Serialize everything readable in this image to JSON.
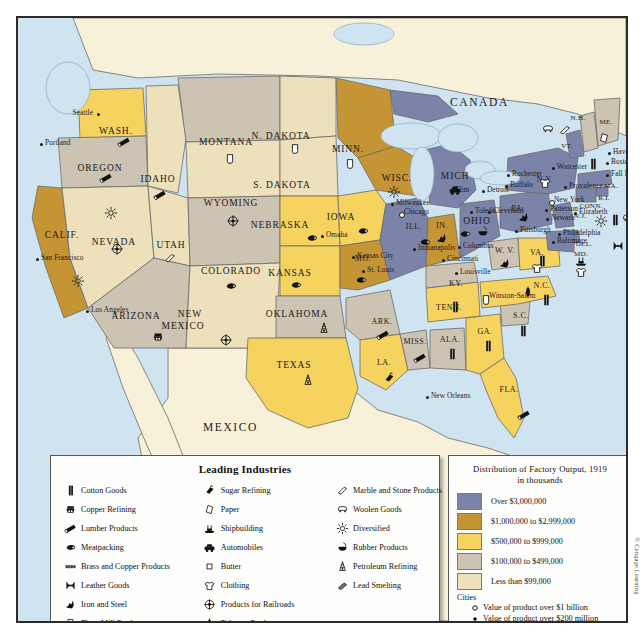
{
  "map": {
    "countries": [
      {
        "name": "CANADA",
        "x": 432,
        "y": 78
      },
      {
        "name": "MEXICO",
        "x": 185,
        "y": 403
      }
    ],
    "states": [
      {
        "abbr": "WASH.",
        "x": 98,
        "y": 113,
        "size": "state"
      },
      {
        "abbr": "OREGON",
        "x": 82,
        "y": 150,
        "size": "state"
      },
      {
        "abbr": "IDAHO",
        "x": 140,
        "y": 161,
        "size": "state"
      },
      {
        "abbr": "MONTANA",
        "x": 208,
        "y": 124,
        "size": "state"
      },
      {
        "abbr": "WYOMING",
        "x": 213,
        "y": 185,
        "size": "state"
      },
      {
        "abbr": "NEVADA",
        "x": 96,
        "y": 224,
        "size": "state"
      },
      {
        "abbr": "CALIF.",
        "x": 44,
        "y": 217,
        "size": "state"
      },
      {
        "abbr": "UTAH",
        "x": 153,
        "y": 227,
        "size": "state"
      },
      {
        "abbr": "COLORADO",
        "x": 213,
        "y": 253,
        "size": "state"
      },
      {
        "abbr": "ARIZONA",
        "x": 118,
        "y": 298,
        "size": "state"
      },
      {
        "abbr": "NEW",
        "x": 172,
        "y": 296,
        "size": "state"
      },
      {
        "abbr": "MEXICO",
        "x": 165,
        "y": 308,
        "size": "state"
      },
      {
        "abbr": "N. DAKOTA",
        "x": 263,
        "y": 118,
        "size": "state"
      },
      {
        "abbr": "S. DAKOTA",
        "x": 264,
        "y": 167,
        "size": "state"
      },
      {
        "abbr": "NEBRASKA",
        "x": 262,
        "y": 207,
        "size": "state"
      },
      {
        "abbr": "KANSAS",
        "x": 272,
        "y": 255,
        "size": "state"
      },
      {
        "abbr": "OKLAHOMA",
        "x": 279,
        "y": 296,
        "size": "state"
      },
      {
        "abbr": "TEXAS",
        "x": 276,
        "y": 347,
        "size": "state"
      },
      {
        "abbr": "MINN.",
        "x": 330,
        "y": 131,
        "size": "state"
      },
      {
        "abbr": "IOWA",
        "x": 323,
        "y": 199,
        "size": "state"
      },
      {
        "abbr": "MO.",
        "x": 345,
        "y": 240,
        "size": "sm"
      },
      {
        "abbr": "ARK.",
        "x": 364,
        "y": 303,
        "size": "sm"
      },
      {
        "abbr": "LA.",
        "x": 366,
        "y": 344,
        "size": "sm"
      },
      {
        "abbr": "WISC.",
        "x": 379,
        "y": 160,
        "size": "state"
      },
      {
        "abbr": "ILL.",
        "x": 396,
        "y": 208,
        "size": "sm"
      },
      {
        "abbr": "MISS.",
        "x": 397,
        "y": 323,
        "size": "sm"
      },
      {
        "abbr": "ALA.",
        "x": 432,
        "y": 321,
        "size": "sm"
      },
      {
        "abbr": "TENN.",
        "x": 431,
        "y": 289,
        "size": "sm"
      },
      {
        "abbr": "KY.",
        "x": 438,
        "y": 265,
        "size": "sm"
      },
      {
        "abbr": "IN.",
        "x": 424,
        "y": 207,
        "size": "sm"
      },
      {
        "abbr": "MICH",
        "x": 437,
        "y": 158,
        "size": "state"
      },
      {
        "abbr": "OHIO",
        "x": 459,
        "y": 203,
        "size": "state"
      },
      {
        "abbr": "GA.",
        "x": 467,
        "y": 313,
        "size": "sm"
      },
      {
        "abbr": "FLA.",
        "x": 491,
        "y": 371,
        "size": "sm"
      },
      {
        "abbr": "S.C.",
        "x": 503,
        "y": 297,
        "size": "sm"
      },
      {
        "abbr": "N.C.",
        "x": 524,
        "y": 267,
        "size": "sm"
      },
      {
        "abbr": "W. V.",
        "x": 487,
        "y": 232,
        "size": "sm"
      },
      {
        "abbr": "VA.",
        "x": 519,
        "y": 234,
        "size": "sm"
      },
      {
        "abbr": "PA.",
        "x": 500,
        "y": 190,
        "size": "sm"
      },
      {
        "abbr": "N.Y.",
        "x": 527,
        "y": 161,
        "size": "sm"
      },
      {
        "abbr": "VT.",
        "x": 549,
        "y": 128,
        "size": "xs"
      },
      {
        "abbr": "N.H.",
        "x": 560,
        "y": 100,
        "size": "xs"
      },
      {
        "abbr": "ME.",
        "x": 588,
        "y": 104,
        "size": "xs"
      },
      {
        "abbr": "MA.",
        "x": 593,
        "y": 168,
        "size": "xs"
      },
      {
        "abbr": "R.I.",
        "x": 586,
        "y": 180,
        "size": "xs"
      },
      {
        "abbr": "CONN.",
        "x": 573,
        "y": 188,
        "size": "xs"
      },
      {
        "abbr": "N.J.",
        "x": 562,
        "y": 198,
        "size": "xs"
      },
      {
        "abbr": "DEL.",
        "x": 566,
        "y": 226,
        "size": "xs"
      },
      {
        "abbr": "MD.",
        "x": 563,
        "y": 236,
        "size": "xs"
      }
    ],
    "cities": [
      {
        "name": "Seattle",
        "x": 79,
        "y": 94,
        "dot": "solid",
        "align": "right"
      },
      {
        "name": "Portland",
        "x": 22,
        "y": 124,
        "dot": "solid",
        "align": "left"
      },
      {
        "name": "San Francisco",
        "x": 18,
        "y": 239,
        "dot": "solid",
        "align": "left"
      },
      {
        "name": "Los Angeles",
        "x": 68,
        "y": 291,
        "dot": "solid",
        "align": "left"
      },
      {
        "name": "Omaha",
        "x": 303,
        "y": 216,
        "dot": "solid",
        "align": "left"
      },
      {
        "name": "Kansas City",
        "x": 334,
        "y": 237,
        "dot": "solid",
        "align": "left"
      },
      {
        "name": "St. Louis",
        "x": 344,
        "y": 251,
        "dot": "solid",
        "align": "left"
      },
      {
        "name": "Milwaukee",
        "x": 373,
        "y": 184,
        "dot": "solid",
        "align": "left"
      },
      {
        "name": "Chicago",
        "x": 381,
        "y": 193,
        "dot": "hollow",
        "align": "left"
      },
      {
        "name": "Indianapolis",
        "x": 395,
        "y": 229,
        "dot": "solid",
        "align": "left"
      },
      {
        "name": "Cincinnati",
        "x": 424,
        "y": 240,
        "dot": "solid",
        "align": "left"
      },
      {
        "name": "Columbus",
        "x": 440,
        "y": 227,
        "dot": "solid",
        "align": "left"
      },
      {
        "name": "Louisville",
        "x": 437,
        "y": 253,
        "dot": "solid",
        "align": "left"
      },
      {
        "name": "Flint",
        "x": 432,
        "y": 171,
        "dot": "solid",
        "align": "left"
      },
      {
        "name": "Detroit",
        "x": 464,
        "y": 171,
        "dot": "solid",
        "align": "left"
      },
      {
        "name": "Toledo",
        "x": 452,
        "y": 192,
        "dot": "solid",
        "align": "left"
      },
      {
        "name": "Cleveland",
        "x": 470,
        "y": 192,
        "dot": "solid",
        "align": "left"
      },
      {
        "name": "Rochester",
        "x": 489,
        "y": 155,
        "dot": "solid",
        "align": "left"
      },
      {
        "name": "Buffalo",
        "x": 487,
        "y": 166,
        "dot": "solid",
        "align": "left"
      },
      {
        "name": "Pittsburgh",
        "x": 497,
        "y": 211,
        "dot": "solid",
        "align": "left"
      },
      {
        "name": "Worcester",
        "x": 534,
        "y": 148,
        "dot": "solid",
        "align": "left"
      },
      {
        "name": "Providence",
        "x": 546,
        "y": 167,
        "dot": "solid",
        "align": "left"
      },
      {
        "name": "Haverhill",
        "x": 590,
        "y": 133,
        "dot": "solid",
        "align": "left"
      },
      {
        "name": "Boston",
        "x": 588,
        "y": 143,
        "dot": "solid",
        "align": "left"
      },
      {
        "name": "Fall River",
        "x": 588,
        "y": 155,
        "dot": "solid",
        "align": "left"
      },
      {
        "name": "New York",
        "x": 531,
        "y": 181,
        "dot": "hollow",
        "align": "left"
      },
      {
        "name": "Patterson",
        "x": 527,
        "y": 190,
        "dot": "solid",
        "align": "left"
      },
      {
        "name": "Newark",
        "x": 528,
        "y": 199,
        "dot": "solid",
        "align": "left"
      },
      {
        "name": "Elizabeth",
        "x": 556,
        "y": 193,
        "dot": "solid",
        "align": "left"
      },
      {
        "name": "Philadelphia",
        "x": 540,
        "y": 214,
        "dot": "solid",
        "align": "left"
      },
      {
        "name": "Baltimore",
        "x": 534,
        "y": 222,
        "dot": "solid",
        "align": "left"
      },
      {
        "name": "Winston-Salem",
        "x": 466,
        "y": 277,
        "dot": "solid",
        "align": "left"
      },
      {
        "name": "New Orleans",
        "x": 408,
        "y": 377,
        "dot": "solid",
        "align": "left"
      }
    ],
    "industry_markers": [
      {
        "icon": "lumber",
        "x": 106,
        "y": 124
      },
      {
        "icon": "lumber",
        "x": 88,
        "y": 160
      },
      {
        "icon": "lumber",
        "x": 142,
        "y": 177
      },
      {
        "icon": "flour",
        "x": 212,
        "y": 141
      },
      {
        "icon": "flour",
        "x": 277,
        "y": 131
      },
      {
        "icon": "railroads",
        "x": 215,
        "y": 203
      },
      {
        "icon": "diversified",
        "x": 93,
        "y": 195
      },
      {
        "icon": "diversified",
        "x": 60,
        "y": 263
      },
      {
        "icon": "railroads",
        "x": 99,
        "y": 231
      },
      {
        "icon": "marble",
        "x": 152,
        "y": 240
      },
      {
        "icon": "railroads",
        "x": 208,
        "y": 322
      },
      {
        "icon": "copper",
        "x": 140,
        "y": 319
      },
      {
        "icon": "meat",
        "x": 294,
        "y": 220
      },
      {
        "icon": "meat",
        "x": 278,
        "y": 267
      },
      {
        "icon": "meat",
        "x": 213,
        "y": 268
      },
      {
        "icon": "petroleum",
        "x": 306,
        "y": 310
      },
      {
        "icon": "petroleum",
        "x": 290,
        "y": 362
      },
      {
        "icon": "flour",
        "x": 332,
        "y": 146
      },
      {
        "icon": "meat",
        "x": 345,
        "y": 213
      },
      {
        "icon": "meat",
        "x": 343,
        "y": 262
      },
      {
        "icon": "lumber",
        "x": 365,
        "y": 317
      },
      {
        "icon": "lumber",
        "x": 402,
        "y": 340
      },
      {
        "icon": "sugar",
        "x": 371,
        "y": 360
      },
      {
        "icon": "cotton",
        "x": 434,
        "y": 336
      },
      {
        "icon": "diversified",
        "x": 376,
        "y": 174
      },
      {
        "icon": "meat",
        "x": 407,
        "y": 224
      },
      {
        "icon": "automobiles",
        "x": 437,
        "y": 172
      },
      {
        "icon": "iron",
        "x": 424,
        "y": 220
      },
      {
        "icon": "meat",
        "x": 447,
        "y": 216
      },
      {
        "icon": "rubber",
        "x": 465,
        "y": 214
      },
      {
        "icon": "flour",
        "x": 468,
        "y": 282
      },
      {
        "icon": "cotton",
        "x": 437,
        "y": 289
      },
      {
        "icon": "cotton",
        "x": 470,
        "y": 328
      },
      {
        "icon": "cotton",
        "x": 505,
        "y": 313
      },
      {
        "icon": "cotton",
        "x": 528,
        "y": 282
      },
      {
        "icon": "tobacco",
        "x": 510,
        "y": 274
      },
      {
        "icon": "cotton",
        "x": 524,
        "y": 243
      },
      {
        "icon": "iron",
        "x": 487,
        "y": 245
      },
      {
        "icon": "iron",
        "x": 506,
        "y": 199
      },
      {
        "icon": "clothing",
        "x": 519,
        "y": 250
      },
      {
        "icon": "lumber",
        "x": 506,
        "y": 397
      },
      {
        "icon": "woolen",
        "x": 530,
        "y": 111
      },
      {
        "icon": "marble",
        "x": 547,
        "y": 112
      },
      {
        "icon": "paper",
        "x": 586,
        "y": 120
      },
      {
        "icon": "clothing",
        "x": 527,
        "y": 165
      },
      {
        "icon": "cotton",
        "x": 575,
        "y": 146
      },
      {
        "icon": "cotton",
        "x": 597,
        "y": 202
      },
      {
        "icon": "woolen",
        "x": 610,
        "y": 200
      },
      {
        "icon": "diversified",
        "x": 583,
        "y": 203
      },
      {
        "icon": "leather",
        "x": 600,
        "y": 228
      },
      {
        "icon": "shipbuilding",
        "x": 563,
        "y": 243
      },
      {
        "icon": "clothing",
        "x": 563,
        "y": 254
      }
    ]
  },
  "legend_industries": {
    "title": "Leading Industries",
    "columns": [
      [
        {
          "icon": "cotton",
          "label": "Cotton Goods"
        },
        {
          "icon": "copper",
          "label": "Copper Refining"
        },
        {
          "icon": "lumber",
          "label": "Lumber Products"
        },
        {
          "icon": "meat",
          "label": "Meatpacking"
        },
        {
          "icon": "brass",
          "label": "Brass and Copper Products"
        },
        {
          "icon": "leather",
          "label": "Leather Goods"
        },
        {
          "icon": "iron",
          "label": "Iron and Steel"
        },
        {
          "icon": "flour",
          "label": "Flour Mill Products"
        }
      ],
      [
        {
          "icon": "sugar",
          "label": "Sugar Refining"
        },
        {
          "icon": "paper",
          "label": "Paper"
        },
        {
          "icon": "shipbuilding",
          "label": "Shipbuilding"
        },
        {
          "icon": "automobiles",
          "label": "Automobiles"
        },
        {
          "icon": "butter",
          "label": "Butter"
        },
        {
          "icon": "clothing",
          "label": "Clothing"
        },
        {
          "icon": "railroads",
          "label": "Products for Railroads"
        },
        {
          "icon": "tobacco",
          "label": "Tobacco Products"
        }
      ],
      [
        {
          "icon": "marble",
          "label": "Marble and Stone Products"
        },
        {
          "icon": "woolen",
          "label": "Woolen Goods"
        },
        {
          "icon": "diversified",
          "label": "Diversified"
        },
        {
          "icon": "rubber",
          "label": "Rubber Products"
        },
        {
          "icon": "petroleum",
          "label": "Petroleum Refining"
        },
        {
          "icon": "lead",
          "label": "Lead Smelting"
        }
      ]
    ]
  },
  "legend_output": {
    "title_line1": "Distribution of Factory Output, 1919",
    "title_line2": "in thousands",
    "bands": [
      {
        "label": "Over $3,000,000",
        "color": "#7b83a8"
      },
      {
        "label": "$1,000,000 to $2,999,000",
        "color": "#c59434"
      },
      {
        "label": "$500,000 to $999,000",
        "color": "#f6d35e"
      },
      {
        "label": "$100,000 to $499,000",
        "color": "#cdc3b2"
      },
      {
        "label": "Less than $99,000",
        "color": "#ede0bb"
      }
    ],
    "cities_heading": "Cities",
    "city_keys": [
      {
        "marker": "hollow",
        "label": "Value of product over $1 billion"
      },
      {
        "marker": "solid",
        "label": "Value of product over $200 million"
      }
    ]
  },
  "credit": "© Cengage Learning",
  "colors": {
    "ocean": "#cfe4f0",
    "land_other": "#f6f1d8",
    "border": "#2b2b2b"
  }
}
